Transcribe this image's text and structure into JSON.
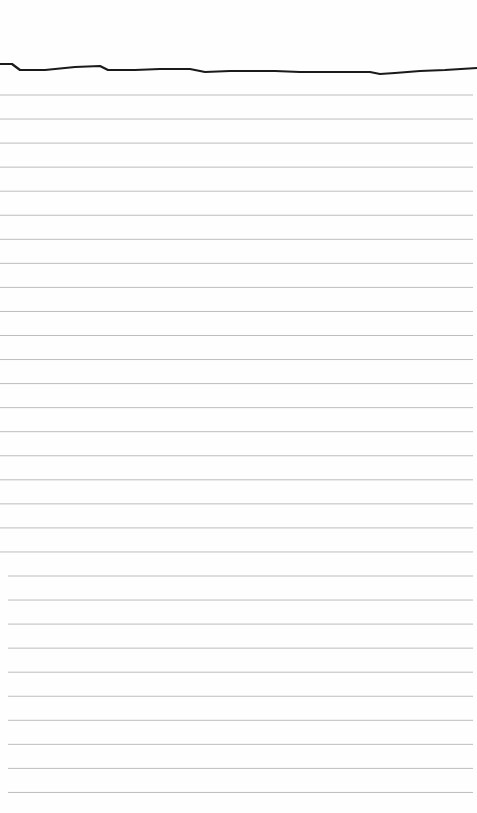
{
  "scene": {
    "description": "Blank sheet of ruled notepad paper with torn top edge",
    "paper_color": "#fefefe",
    "rule_color": "#bdbdbd",
    "edge_color": "#1a1a1a",
    "ruled_line_count": 30,
    "text_content": ""
  }
}
